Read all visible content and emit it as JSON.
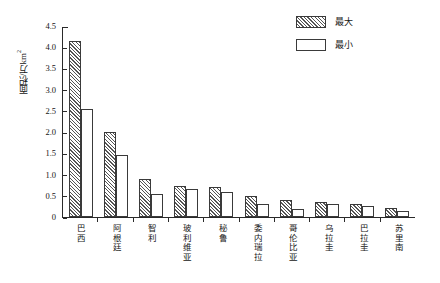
{
  "chart_data": {
    "type": "bar",
    "title": "",
    "xlabel": "",
    "ylabel": "面积/万km²",
    "ylabel_main": "面积/万km",
    "ylabel_sup": "2",
    "ylim": [
      0,
      4.5
    ],
    "ytick_labels": [
      "4.5",
      "4.0",
      "3.5",
      "3.0",
      "2.5",
      "2.0",
      "1.5",
      "1.0",
      "0.5",
      "0"
    ],
    "ytick_values": [
      4.5,
      4.0,
      3.5,
      3.0,
      2.5,
      2.0,
      1.5,
      1.0,
      0.5,
      0
    ],
    "grid": false,
    "legend_position": "top-right",
    "categories": [
      "巴西",
      "阿根廷",
      "智利",
      "玻利维亚",
      "秘鲁",
      "委内瑞拉",
      "哥伦比亚",
      "乌拉圭",
      "巴拉圭",
      "苏里南"
    ],
    "series": [
      {
        "name": "最大",
        "pattern": "diagonal-hatch",
        "values": [
          4.15,
          2.0,
          0.9,
          0.72,
          0.7,
          0.5,
          0.4,
          0.35,
          0.3,
          0.22
        ]
      },
      {
        "name": "最小",
        "pattern": "empty",
        "values": [
          2.55,
          1.45,
          0.55,
          0.65,
          0.6,
          0.3,
          0.2,
          0.3,
          0.25,
          0.15
        ]
      }
    ]
  },
  "legend": {
    "items": [
      {
        "label": "最大",
        "pattern": "diagonal-hatch"
      },
      {
        "label": "最小",
        "pattern": "empty"
      }
    ]
  },
  "colors": {
    "axis": "#2a2a2a",
    "bar_outline": "#3a3a3a",
    "hatch": "#555555",
    "background": "#ffffff",
    "text": "#161616"
  }
}
